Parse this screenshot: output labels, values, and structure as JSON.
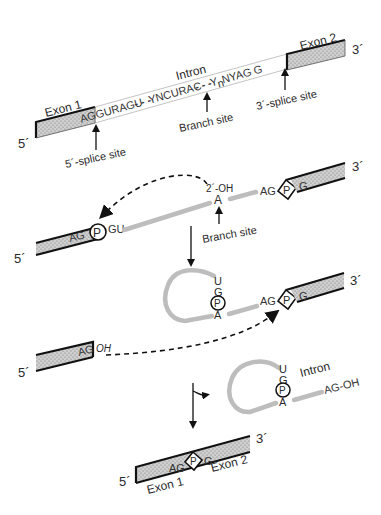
{
  "diagram": {
    "colors": {
      "exon_fill": "#c8c8c8",
      "exon_border": "#111111",
      "intron_line": "#bdbdbd",
      "text": "#2a2a2a"
    },
    "panel1": {
      "five_prime": "5´",
      "three_prime": "3´",
      "exon1_label": "Exon 1",
      "exon2_label": "Exon 2",
      "intron_label": "Intron",
      "exon1_end": "AG",
      "seq_5ss": "GURAGU",
      "dashes": "- - -",
      "seq_branch": "YNCURAC",
      "seq_3ss_y": "Y",
      "seq_3ss_sub": "n",
      "seq_3ss_rest": "NYAG",
      "exon2_start": "G",
      "five_splice_site": "5´-splice site",
      "branch_site": "Branch site",
      "three_splice_site": "3´-splice site"
    },
    "panel2": {
      "five_prime": "5´",
      "three_prime": "3´",
      "exon1_end": "AG",
      "phosphate": "P",
      "gu": "GU",
      "oh_label": "2´-OH",
      "branch_a": "A",
      "ag": "AG",
      "phosphate2": "P",
      "exon2_start": "G",
      "branch_site": "Branch site"
    },
    "panel3": {
      "three_prime": "3´",
      "u": "U",
      "g": "G",
      "phosphate": "P",
      "a": "A",
      "ag": "AG",
      "phosphate2": "P",
      "exon2_start": "G",
      "five_prime": "5´",
      "exon1_end": "AG",
      "oh": "OH"
    },
    "panel4": {
      "u": "U",
      "g": "G",
      "phosphate": "P",
      "a": "A",
      "intron_label": "Intron",
      "ag_oh": "AG-OH",
      "five_prime": "5´",
      "three_prime": "3´",
      "ag": "AG",
      "phosphate2": "P",
      "g_end": "G",
      "exon1_label": "Exon 1",
      "exon2_label": "Exon 2"
    }
  }
}
